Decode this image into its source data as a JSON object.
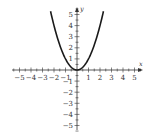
{
  "chart_data": {
    "type": "line",
    "title": "",
    "xlabel": "x",
    "ylabel": "y",
    "function": "y = x^2",
    "xlim": [
      -5,
      5
    ],
    "ylim": [
      -5,
      5
    ],
    "grid": false,
    "x_ticks": [
      -5,
      -4,
      -3,
      -2,
      -1,
      1,
      2,
      3,
      4,
      5
    ],
    "y_ticks": [
      -5,
      -4,
      -3,
      -2,
      -1,
      1,
      2,
      3,
      4,
      5
    ],
    "x_tick_labels": [
      "−5",
      "−4",
      "−3",
      "−2",
      "−1",
      "1",
      "2",
      "3",
      "4",
      "5"
    ],
    "y_tick_labels": [
      "5",
      "4",
      "3",
      "2",
      "1",
      "−1",
      "−2",
      "−3",
      "−4",
      "−5"
    ],
    "series": [
      {
        "name": "y = x^2",
        "x": [
          -2.3,
          -2,
          -1.5,
          -1,
          -0.5,
          0,
          0.5,
          1,
          1.5,
          2,
          2.3
        ],
        "y": [
          5.29,
          4,
          2.25,
          1,
          0.25,
          0,
          0.25,
          1,
          2.25,
          4,
          5.29
        ]
      }
    ],
    "colors": {
      "curve": "#1a1a1a",
      "axis": "#333333"
    }
  }
}
